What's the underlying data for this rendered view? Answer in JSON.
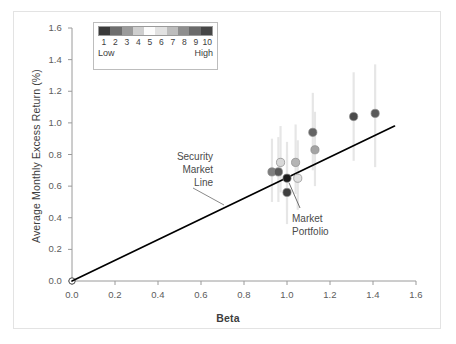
{
  "chart_data": {
    "type": "scatter",
    "title": "",
    "xlabel": "Beta",
    "ylabel": "Average Monthly Excess Return (%)",
    "xlim": [
      0.0,
      1.6
    ],
    "ylim": [
      0.0,
      1.6
    ],
    "xticks": [
      "0.0",
      "0.2",
      "0.4",
      "0.6",
      "0.8",
      "1.0",
      "1.2",
      "1.4",
      "1.6"
    ],
    "yticks": [
      "0.0",
      "0.2",
      "0.4",
      "0.6",
      "0.8",
      "1.0",
      "1.2",
      "1.4",
      "1.6"
    ],
    "grid": false,
    "legend_position": "top-left",
    "points": [
      {
        "label": "1",
        "beta": 0.93,
        "return": 0.69,
        "color": "#7d7d7d",
        "err_low": 0.5,
        "err_high": 0.9
      },
      {
        "label": "2",
        "beta": 0.96,
        "return": 0.69,
        "color": "#575757",
        "err_low": 0.5,
        "err_high": 0.91
      },
      {
        "label": "3",
        "beta": 0.97,
        "return": 0.75,
        "color": "#d8d8d8",
        "err_low": 0.56,
        "err_high": 0.98
      },
      {
        "label": "4",
        "beta": 1.0,
        "return": 0.65,
        "color": "#1a1a1a",
        "err_low": 0.45,
        "err_high": 0.88,
        "annotation": "Market Portfolio"
      },
      {
        "label": "5",
        "beta": 1.0,
        "return": 0.56,
        "color": "#3f3f3f",
        "err_low": 0.36,
        "err_high": 0.8
      },
      {
        "label": "6",
        "beta": 1.04,
        "return": 0.75,
        "color": "#b4b4b4",
        "err_low": 0.55,
        "err_high": 0.99
      },
      {
        "label": "7",
        "beta": 1.05,
        "return": 0.65,
        "color": "#e0e0e0",
        "err_low": 0.45,
        "err_high": 0.89
      },
      {
        "label": "8",
        "beta": 1.12,
        "return": 0.94,
        "color": "#636363",
        "err_low": 0.7,
        "err_high": 1.19
      },
      {
        "label": "9",
        "beta": 1.13,
        "return": 0.83,
        "color": "#a3a3a3",
        "err_low": 0.6,
        "err_high": 1.07
      },
      {
        "label": "10",
        "beta": 1.31,
        "return": 1.04,
        "color": "#4a4a4a",
        "err_low": 0.76,
        "err_high": 1.32
      },
      {
        "label": "11",
        "beta": 1.41,
        "return": 1.06,
        "color": "#5a5a5a",
        "err_low": 0.72,
        "err_high": 1.37
      }
    ],
    "security_market_line": {
      "name": "Security Market Line",
      "from": {
        "beta": 0.0,
        "return": 0.0
      },
      "to": {
        "beta": 1.5,
        "return": 0.98
      },
      "color": "#000000"
    },
    "annotations": [
      {
        "name": "security-market-line",
        "lines": [
          "Security",
          "Market",
          "Line"
        ]
      },
      {
        "name": "market-portfolio",
        "lines": [
          "Market",
          "Portfolio"
        ]
      }
    ]
  },
  "legend": {
    "numbers": [
      "1",
      "2",
      "3",
      "4",
      "5",
      "6",
      "7",
      "8",
      "9",
      "10"
    ],
    "low_label": "Low",
    "high_label": "High",
    "swatch_colors": [
      "#3a3a3a",
      "#6e6e6e",
      "#9b9b9b",
      "#cfcfcf",
      "#fcfcfc",
      "#e2e2e2",
      "#bdbdbd",
      "#8e8e8e",
      "#6a6a6a",
      "#464646"
    ]
  },
  "style": {
    "axis_color": "#9a9a9a",
    "text_color": "#3d3d3d",
    "frame_color": "#e3e3e3",
    "errorbar_color": "#e6e6e6"
  }
}
